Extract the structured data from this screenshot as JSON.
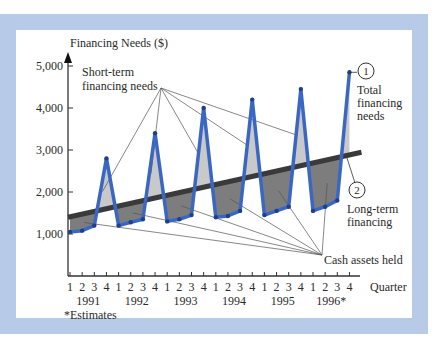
{
  "chart_data": {
    "type": "line",
    "title": "",
    "ylabel": "Financing Needs ($)",
    "xlabel": "Quarter",
    "ylim": [
      0,
      5000
    ],
    "yticks": [
      1000,
      2000,
      3000,
      4000,
      5000
    ],
    "ytick_labels": [
      "1,000",
      "2,000",
      "3,000",
      "4,000",
      "5,000"
    ],
    "quarter_labels": [
      "1",
      "2",
      "3",
      "4",
      "1",
      "2",
      "3",
      "4",
      "1",
      "2",
      "3",
      "4",
      "1",
      "2",
      "3",
      "4",
      "1",
      "2",
      "3",
      "4",
      "1",
      "2",
      "3",
      "4"
    ],
    "year_labels": [
      "1991",
      "1992",
      "1993",
      "1994",
      "1995",
      "1996*"
    ],
    "grid": false,
    "series": [
      {
        "name": "Total financing needs",
        "marker": "1",
        "color": "#3b67c4",
        "values": [
          1050,
          1080,
          1200,
          2800,
          1200,
          1280,
          1350,
          3400,
          1300,
          1350,
          1450,
          4000,
          1400,
          1430,
          1550,
          4200,
          1450,
          1550,
          1650,
          4450,
          1550,
          1650,
          1800,
          4850
        ]
      },
      {
        "name": "Long-term financing",
        "marker": "2",
        "color": "#3a3a3a",
        "start": 1400,
        "end": 2900
      }
    ],
    "annotations": [
      {
        "text": "Short-term financing needs",
        "line1": "Short-term",
        "line2": "financing needs"
      },
      {
        "text": "Cash assets held"
      },
      {
        "text": "Total financing needs",
        "line1": "Total",
        "line2": "financing",
        "line3": "needs"
      },
      {
        "text": "Long-term financing",
        "line1": "Long-term",
        "line2": "financing"
      }
    ],
    "footnote": "*Estimates",
    "colors": {
      "frame": "#b7cbe9",
      "total_line": "#3b67c4",
      "short_term_fill": "#c9c9c9",
      "cash_fill": "#7d7d7d",
      "long_term_line": "#3a3a3a"
    }
  }
}
